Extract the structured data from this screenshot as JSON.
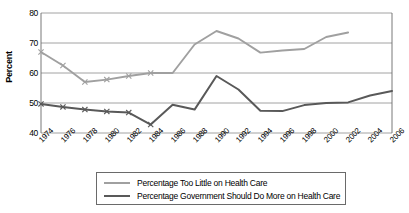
{
  "chart": {
    "type": "line",
    "ylabel": "Percent",
    "xlabel": ""
  },
  "chart_data": {
    "type": "line",
    "title": "",
    "xlabel": "",
    "ylabel": "Percent",
    "ylim": [
      40,
      80
    ],
    "yticks": [
      40,
      50,
      60,
      70,
      80
    ],
    "grid": "horizontal",
    "legend_position": "bottom",
    "x": [
      1974,
      1976,
      1978,
      1980,
      1982,
      1984,
      1986,
      1988,
      1990,
      1992,
      1994,
      1996,
      1998,
      2000,
      2002,
      2004,
      2006
    ],
    "categories": [
      "1974",
      "1976",
      "1978",
      "1980",
      "1982",
      "1984",
      "1986",
      "1988",
      "1990",
      "1992",
      "1994",
      "1996",
      "1998",
      "2000",
      "2002",
      "2004",
      "2006"
    ],
    "series": [
      {
        "name": "Percentage Too Little on Health Care",
        "color": "#a0a0a0",
        "marker": "x",
        "values": [
          67,
          62.5,
          57,
          57.8,
          59,
          60,
          60,
          69.5,
          74,
          71.5,
          66.8,
          67.5,
          68,
          72,
          73.5,
          null,
          null
        ]
      },
      {
        "name": "Percentage Government Should Do More on Health Care",
        "color": "#595959",
        "marker": "x",
        "values": [
          49.7,
          48.7,
          47.8,
          47.2,
          46.8,
          42.8,
          49.4,
          47.8,
          59,
          54.5,
          47.4,
          47.3,
          49.3,
          50,
          50.2,
          52.5,
          54
        ]
      }
    ]
  },
  "legend": {
    "items": [
      {
        "label": "Percentage Too Little on Health Care"
      },
      {
        "label": "Percentage Government Should Do More on Health Care"
      }
    ]
  }
}
